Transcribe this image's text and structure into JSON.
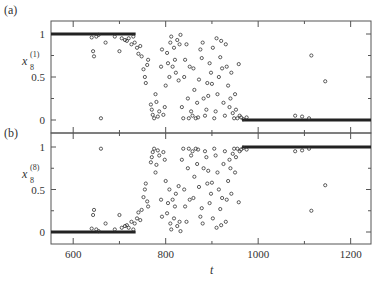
{
  "chart_data": [
    {
      "type": "scatter",
      "panel_label": "(a)",
      "title": "",
      "xlabel": "t",
      "ylabel": "x_8^(1)",
      "ylabel_base": "x",
      "ylabel_sub": "8",
      "ylabel_sup": "(1)",
      "xlim": [
        552,
        1244
      ],
      "ylim": [
        -0.1,
        1.1
      ],
      "yticks": [
        0,
        0.5,
        1
      ],
      "ytick_labels": [
        "0",
        "0.5",
        "1"
      ],
      "yminor": [
        0.25,
        0.75
      ],
      "grid": false,
      "description": "Values near 1 until t~720, scattered between 0 and 1 for t~740-960, then near 0 after t~970",
      "dense_band": [
        {
          "from": 552,
          "to": 735,
          "y": 1.0
        },
        {
          "from": 965,
          "to": 1244,
          "y": 0.0
        }
      ],
      "points": [
        [
          640,
          0.96
        ],
        [
          643,
          0.8
        ],
        [
          645,
          0.74
        ],
        [
          650,
          0.97
        ],
        [
          655,
          0.99
        ],
        [
          660,
          0.02
        ],
        [
          670,
          0.9
        ],
        [
          690,
          0.97
        ],
        [
          700,
          0.8
        ],
        [
          705,
          0.95
        ],
        [
          712,
          0.93
        ],
        [
          716,
          0.92
        ],
        [
          720,
          0.95
        ],
        [
          726,
          0.88
        ],
        [
          730,
          0.97
        ],
        [
          733,
          0.9
        ],
        [
          738,
          0.84
        ],
        [
          741,
          0.77
        ],
        [
          745,
          0.86
        ],
        [
          748,
          0.74
        ],
        [
          752,
          0.59
        ],
        [
          755,
          0.5
        ],
        [
          757,
          0.43
        ],
        [
          760,
          0.64
        ],
        [
          762,
          0.7
        ],
        [
          768,
          0.18
        ],
        [
          770,
          0.12
        ],
        [
          772,
          0.06
        ],
        [
          775,
          0.02
        ],
        [
          778,
          0.3
        ],
        [
          780,
          0.21
        ],
        [
          783,
          0.04
        ],
        [
          786,
          0.1
        ],
        [
          790,
          0.62
        ],
        [
          792,
          0.82
        ],
        [
          795,
          0.06
        ],
        [
          798,
          0.15
        ],
        [
          800,
          0.4
        ],
        [
          803,
          0.78
        ],
        [
          805,
          0.66
        ],
        [
          808,
          0.5
        ],
        [
          810,
          0.9
        ],
        [
          812,
          0.97
        ],
        [
          815,
          0.62
        ],
        [
          818,
          0.84
        ],
        [
          820,
          0.7
        ],
        [
          822,
          0.55
        ],
        [
          825,
          0.93
        ],
        [
          828,
          0.46
        ],
        [
          830,
          0.88
        ],
        [
          832,
          0.99
        ],
        [
          835,
          0.15
        ],
        [
          838,
          0.02
        ],
        [
          840,
          0.5
        ],
        [
          842,
          0.7
        ],
        [
          845,
          0.88
        ],
        [
          848,
          0.25
        ],
        [
          850,
          0.02
        ],
        [
          852,
          0.62
        ],
        [
          855,
          0.1
        ],
        [
          858,
          0.05
        ],
        [
          860,
          0.6
        ],
        [
          862,
          0.35
        ],
        [
          865,
          0.02
        ],
        [
          868,
          0.2
        ],
        [
          870,
          0.03
        ],
        [
          872,
          0.47
        ],
        [
          875,
          0.82
        ],
        [
          878,
          0.72
        ],
        [
          880,
          0.9
        ],
        [
          882,
          0.25
        ],
        [
          885,
          0.05
        ],
        [
          888,
          0.12
        ],
        [
          890,
          0.43
        ],
        [
          892,
          0.28
        ],
        [
          895,
          0.66
        ],
        [
          898,
          0.55
        ],
        [
          900,
          0.42
        ],
        [
          902,
          0.84
        ],
        [
          905,
          0.02
        ],
        [
          908,
          0.1
        ],
        [
          910,
          0.95
        ],
        [
          912,
          0.3
        ],
        [
          915,
          0.5
        ],
        [
          918,
          0.73
        ],
        [
          920,
          0.92
        ],
        [
          922,
          0.6
        ],
        [
          925,
          0.2
        ],
        [
          928,
          0.05
        ],
        [
          930,
          0.88
        ],
        [
          932,
          0.62
        ],
        [
          935,
          0.4
        ],
        [
          938,
          0.15
        ],
        [
          940,
          0.25
        ],
        [
          942,
          0.55
        ],
        [
          945,
          0.08
        ],
        [
          948,
          0.02
        ],
        [
          950,
          0.3
        ],
        [
          952,
          0.12
        ],
        [
          955,
          0.02
        ],
        [
          958,
          0.65
        ],
        [
          960,
          0.05
        ],
        [
          963,
          0.03
        ],
        [
          968,
          0.01
        ],
        [
          975,
          0.03
        ],
        [
          1080,
          0.05
        ],
        [
          1095,
          0.04
        ],
        [
          1110,
          0.02
        ],
        [
          1115,
          0.75
        ],
        [
          1145,
          0.45
        ]
      ]
    },
    {
      "type": "scatter",
      "panel_label": "(b)",
      "title": "",
      "xlabel": "t",
      "ylabel": "x_8^(8)",
      "ylabel_base": "x",
      "ylabel_sub": "8",
      "ylabel_sup": "(8)",
      "xlim": [
        552,
        1244
      ],
      "ylim": [
        -0.1,
        1.1
      ],
      "yticks": [
        0,
        0.5,
        1
      ],
      "ytick_labels": [
        "0",
        "0.5",
        "1"
      ],
      "yminor": [
        0.25,
        0.75
      ],
      "xticks": [
        600,
        800,
        1000,
        1200
      ],
      "xtick_labels": [
        "600",
        "800",
        "1000",
        "1200"
      ],
      "xminor": [
        700,
        900,
        1100
      ],
      "grid": false,
      "description": "Values near 0 until t~720, scattered between 0 and 1 for t~740-960, then near 1 after t~970",
      "dense_band": [
        {
          "from": 552,
          "to": 735,
          "y": 0.0
        },
        {
          "from": 965,
          "to": 1244,
          "y": 1.0
        }
      ],
      "points": [
        [
          640,
          0.04
        ],
        [
          643,
          0.2
        ],
        [
          645,
          0.26
        ],
        [
          650,
          0.03
        ],
        [
          655,
          0.01
        ],
        [
          660,
          0.98
        ],
        [
          670,
          0.1
        ],
        [
          690,
          0.03
        ],
        [
          700,
          0.2
        ],
        [
          705,
          0.05
        ],
        [
          712,
          0.07
        ],
        [
          716,
          0.08
        ],
        [
          720,
          0.05
        ],
        [
          726,
          0.12
        ],
        [
          730,
          0.03
        ],
        [
          733,
          0.1
        ],
        [
          738,
          0.16
        ],
        [
          741,
          0.23
        ],
        [
          745,
          0.14
        ],
        [
          748,
          0.26
        ],
        [
          752,
          0.41
        ],
        [
          755,
          0.5
        ],
        [
          757,
          0.57
        ],
        [
          760,
          0.36
        ],
        [
          762,
          0.3
        ],
        [
          768,
          0.82
        ],
        [
          770,
          0.88
        ],
        [
          772,
          0.94
        ],
        [
          775,
          0.98
        ],
        [
          778,
          0.7
        ],
        [
          780,
          0.79
        ],
        [
          783,
          0.96
        ],
        [
          786,
          0.9
        ],
        [
          790,
          0.38
        ],
        [
          792,
          0.18
        ],
        [
          795,
          0.94
        ],
        [
          798,
          0.85
        ],
        [
          800,
          0.6
        ],
        [
          803,
          0.22
        ],
        [
          805,
          0.34
        ],
        [
          808,
          0.5
        ],
        [
          810,
          0.1
        ],
        [
          812,
          0.03
        ],
        [
          815,
          0.38
        ],
        [
          818,
          0.16
        ],
        [
          820,
          0.3
        ],
        [
          822,
          0.45
        ],
        [
          825,
          0.07
        ],
        [
          828,
          0.54
        ],
        [
          830,
          0.12
        ],
        [
          832,
          0.01
        ],
        [
          835,
          0.85
        ],
        [
          838,
          0.98
        ],
        [
          840,
          0.5
        ],
        [
          842,
          0.3
        ],
        [
          845,
          0.12
        ],
        [
          848,
          0.75
        ],
        [
          850,
          0.98
        ],
        [
          852,
          0.38
        ],
        [
          855,
          0.9
        ],
        [
          858,
          0.95
        ],
        [
          860,
          0.4
        ],
        [
          862,
          0.65
        ],
        [
          865,
          0.98
        ],
        [
          868,
          0.8
        ],
        [
          870,
          0.97
        ],
        [
          872,
          0.53
        ],
        [
          875,
          0.18
        ],
        [
          878,
          0.28
        ],
        [
          880,
          0.1
        ],
        [
          882,
          0.75
        ],
        [
          885,
          0.95
        ],
        [
          888,
          0.88
        ],
        [
          890,
          0.57
        ],
        [
          892,
          0.72
        ],
        [
          895,
          0.34
        ],
        [
          898,
          0.45
        ],
        [
          900,
          0.58
        ],
        [
          902,
          0.16
        ],
        [
          905,
          0.98
        ],
        [
          908,
          0.9
        ],
        [
          910,
          0.05
        ],
        [
          912,
          0.7
        ],
        [
          915,
          0.5
        ],
        [
          918,
          0.27
        ],
        [
          920,
          0.08
        ],
        [
          922,
          0.4
        ],
        [
          925,
          0.8
        ],
        [
          928,
          0.95
        ],
        [
          930,
          0.12
        ],
        [
          932,
          0.38
        ],
        [
          935,
          0.6
        ],
        [
          938,
          0.85
        ],
        [
          940,
          0.75
        ],
        [
          942,
          0.45
        ],
        [
          945,
          0.92
        ],
        [
          948,
          0.98
        ],
        [
          950,
          0.7
        ],
        [
          952,
          0.88
        ],
        [
          955,
          0.98
        ],
        [
          958,
          0.35
        ],
        [
          960,
          0.95
        ],
        [
          963,
          0.97
        ],
        [
          968,
          0.99
        ],
        [
          975,
          0.97
        ],
        [
          1080,
          0.95
        ],
        [
          1095,
          0.96
        ],
        [
          1110,
          0.98
        ],
        [
          1115,
          0.25
        ],
        [
          1145,
          0.55
        ]
      ]
    }
  ],
  "labels": {
    "panel_a": "(a)",
    "panel_b": "(b)",
    "xaxis_title": "t"
  }
}
